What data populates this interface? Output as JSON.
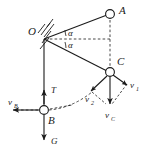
{
  "diagram": {
    "background_color": "#ffffff",
    "stroke_color": "#1a1a1a",
    "points": {
      "O": {
        "label": "O",
        "x": 43,
        "y": 38,
        "role": "pivot-support"
      },
      "A": {
        "label": "A",
        "x": 110,
        "y": 14,
        "role": "upper-mass"
      },
      "C": {
        "label": "C",
        "x": 110,
        "y": 72,
        "role": "lower-mass"
      },
      "B": {
        "label": "B",
        "x": 44,
        "y": 110,
        "role": "hanging-mass"
      }
    },
    "angles": [
      {
        "label": "α",
        "at": "O",
        "position": "upper",
        "between": "OA and horizontal"
      },
      {
        "label": "α",
        "at": "O",
        "position": "lower",
        "between": "horizontal and OC"
      }
    ],
    "vectors": [
      {
        "name": "T",
        "label": "T",
        "base": "B",
        "direction": "up",
        "style": "solid"
      },
      {
        "name": "G",
        "label": "G",
        "base": "B",
        "direction": "down",
        "style": "solid"
      },
      {
        "name": "vB",
        "label": "v",
        "sub": "B",
        "base": "B",
        "direction": "left",
        "style": "solid"
      },
      {
        "name": "v1",
        "label": "v",
        "sub": "1",
        "base": "C",
        "direction": "down-right",
        "style": "solid"
      },
      {
        "name": "v2",
        "label": "v",
        "sub": "2",
        "base": "C",
        "direction": "down-left",
        "style": "solid"
      },
      {
        "name": "vC",
        "label": "v",
        "sub": "C",
        "base": "C",
        "direction": "down",
        "style": "solid"
      }
    ],
    "solid_lines": [
      {
        "from": "O",
        "to": "A"
      },
      {
        "from": "O",
        "to": "C"
      },
      {
        "from": "O",
        "to": "B"
      }
    ],
    "dashed_lines": [
      {
        "from": "O",
        "to": "horizontal-right",
        "note": "angle bisector reference"
      },
      {
        "from": "A",
        "to": "C",
        "note": "vertical drop"
      },
      {
        "from": "B",
        "to": "left",
        "note": "vB extension"
      },
      {
        "from": "B",
        "to": "C",
        "note": "curved trajectory arc"
      }
    ],
    "support": {
      "type": "hatched-fixed-support",
      "at": "O",
      "hatch_count": 5
    }
  }
}
